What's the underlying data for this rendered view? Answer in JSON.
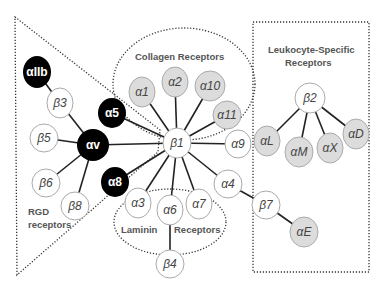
{
  "groups": {
    "rgd": {
      "label_line1": "RGD",
      "label_line2": "receptors"
    },
    "collagen": {
      "label": "Collagen Receptors"
    },
    "laminin": {
      "label_left": "Laminin",
      "label_right": "Receptors"
    },
    "leukocyte": {
      "label_line1": "Leukocyte-Specific",
      "label_line2": "Receptors"
    }
  },
  "colors": {
    "black_node": "#000000",
    "gray_node": "#dcdcdc",
    "white_node": "#ffffff",
    "node_border": "#aaaaaa",
    "edge": "#222222"
  },
  "nodes": {
    "aIIb": "αIIb",
    "b3": "β3",
    "a5": "α5",
    "av": "αv",
    "b5": "β5",
    "b6": "β6",
    "b8": "β8",
    "a8": "α8",
    "b1": "β1",
    "a1": "α1",
    "a2": "α2",
    "a10": "α10",
    "a11": "α11",
    "a9": "α9",
    "a4": "α4",
    "a3": "α3",
    "a6": "α6",
    "a7": "α7",
    "b4": "β4",
    "b7": "β7",
    "aE": "αE",
    "b2": "β2",
    "aL": "αL",
    "aM": "αM",
    "aX": "αX",
    "aD": "αD"
  }
}
